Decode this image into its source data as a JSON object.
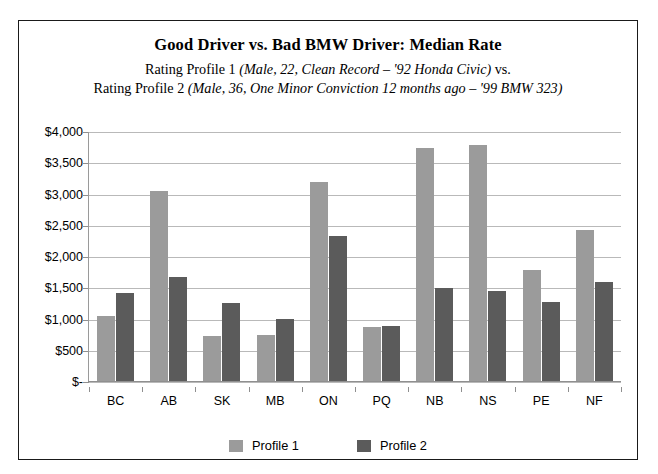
{
  "chart_data": {
    "type": "bar",
    "title": "Good Driver vs. Bad BMW Driver: Median Rate",
    "subtitle_line_1_plain": "Rating Profile 1 ",
    "subtitle_line_1_italic": "(Male, 22, Clean Record – '92 Honda Civic)",
    "subtitle_line_1_tail": " vs.",
    "subtitle_line_2_plain": "Rating Profile 2 ",
    "subtitle_line_2_italic": "(Male, 36, One Minor Conviction 12 months ago – '99 BMW 323)",
    "xlabel": "",
    "ylabel": "",
    "ylim": [
      0,
      4000
    ],
    "ytick_values": [
      0,
      500,
      1000,
      1500,
      2000,
      2500,
      3000,
      3500,
      4000
    ],
    "ytick_labels": [
      "$-",
      "$500",
      "$1,000",
      "$1,500",
      "$2,000",
      "$2,500",
      "$3,000",
      "$3,500",
      "$4,000"
    ],
    "grid": true,
    "legend_position": "bottom",
    "categories": [
      "BC",
      "AB",
      "SK",
      "MB",
      "ON",
      "PQ",
      "NB",
      "NS",
      "PE",
      "NF"
    ],
    "series": [
      {
        "name": "Profile 1",
        "color": "#9b9b9b",
        "values": [
          1050,
          3060,
          730,
          750,
          3200,
          880,
          3750,
          3790,
          1790,
          2440
        ]
      },
      {
        "name": "Profile 2",
        "color": "#5b5b5b",
        "values": [
          1420,
          1680,
          1260,
          1010,
          2340,
          890,
          1500,
          1460,
          1280,
          1600
        ]
      }
    ]
  },
  "legend": {
    "items": [
      {
        "label": "Profile 1",
        "color": "#9b9b9b"
      },
      {
        "label": "Profile 2",
        "color": "#5b5b5b"
      }
    ]
  }
}
